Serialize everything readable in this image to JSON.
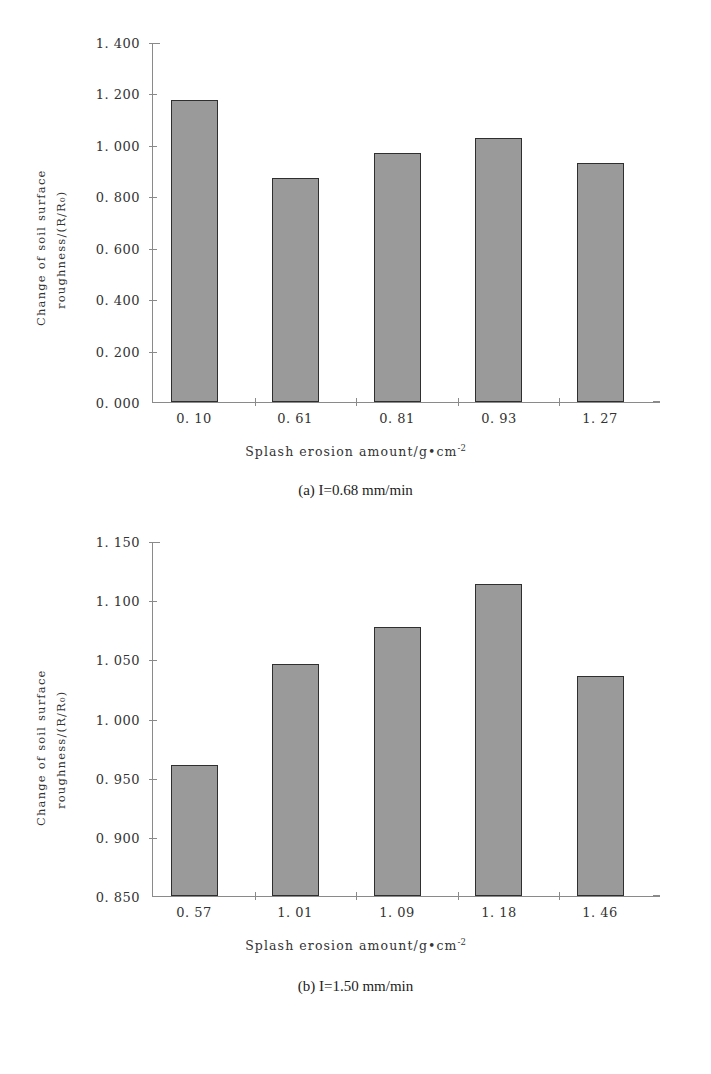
{
  "figures": [
    {
      "id": "a",
      "caption": "(a) I=0.68 mm/min",
      "ylabel_line1": "Change of soil surface",
      "ylabel_line2": "roughness/(R/R₀)",
      "xlabel_main": "Splash erosion amount/g•cm",
      "xlabel_sup": "-2",
      "yticks": [
        "1. 400",
        "1. 200",
        "1. 000",
        "0. 800",
        "0. 600",
        "0. 400",
        "0. 200",
        "0. 000"
      ],
      "xticks": [
        "0. 10",
        "0. 61",
        "0. 81",
        "0. 93",
        "1. 27"
      ]
    },
    {
      "id": "b",
      "caption": "(b) I=1.50 mm/min",
      "ylabel_line1": "Change of soil surface",
      "ylabel_line2": "roughness/(R/R₀)",
      "xlabel_main": "Splash erosion amount/g•cm",
      "xlabel_sup": "-2",
      "yticks": [
        "1. 150",
        "1. 100",
        "1. 050",
        "1. 000",
        "0. 950",
        "0. 900",
        "0. 850"
      ],
      "xticks": [
        "0. 57",
        "1. 01",
        "1. 09",
        "1. 18",
        "1. 46"
      ]
    }
  ],
  "chart_data": [
    {
      "type": "bar",
      "panel": "(a) I=0.68 mm/min",
      "title": "",
      "categories": [
        "0.10",
        "0.61",
        "0.81",
        "0.93",
        "1.27"
      ],
      "values": [
        1.175,
        0.873,
        0.967,
        1.028,
        0.93
      ],
      "xlabel": "Splash erosion amount/g•cm-2",
      "ylabel": "Change of soil surface roughness/(R/R0)",
      "ylim": [
        0.0,
        1.4
      ],
      "ytick_step": 0.2,
      "ytick_values": [
        0.0,
        0.2,
        0.4,
        0.6,
        0.8,
        1.0,
        1.2,
        1.4
      ],
      "grid": false,
      "legend": "none",
      "bar_color": "#9a9a9a",
      "bar_edge_color": "#2f2f2f"
    },
    {
      "type": "bar",
      "panel": "(b) I=1.50 mm/min",
      "title": "",
      "categories": [
        "0.57",
        "1.01",
        "1.09",
        "1.18",
        "1.46"
      ],
      "values": [
        0.961,
        1.046,
        1.077,
        1.114,
        1.036
      ],
      "xlabel": "Splash erosion amount/g•cm-2",
      "ylabel": "Change of soil surface roughness/(R/R0)",
      "ylim": [
        0.85,
        1.15
      ],
      "ytick_step": 0.05,
      "ytick_values": [
        0.85,
        0.9,
        0.95,
        1.0,
        1.05,
        1.1,
        1.15
      ],
      "grid": false,
      "legend": "none",
      "bar_color": "#9a9a9a",
      "bar_edge_color": "#2f2f2f"
    }
  ]
}
